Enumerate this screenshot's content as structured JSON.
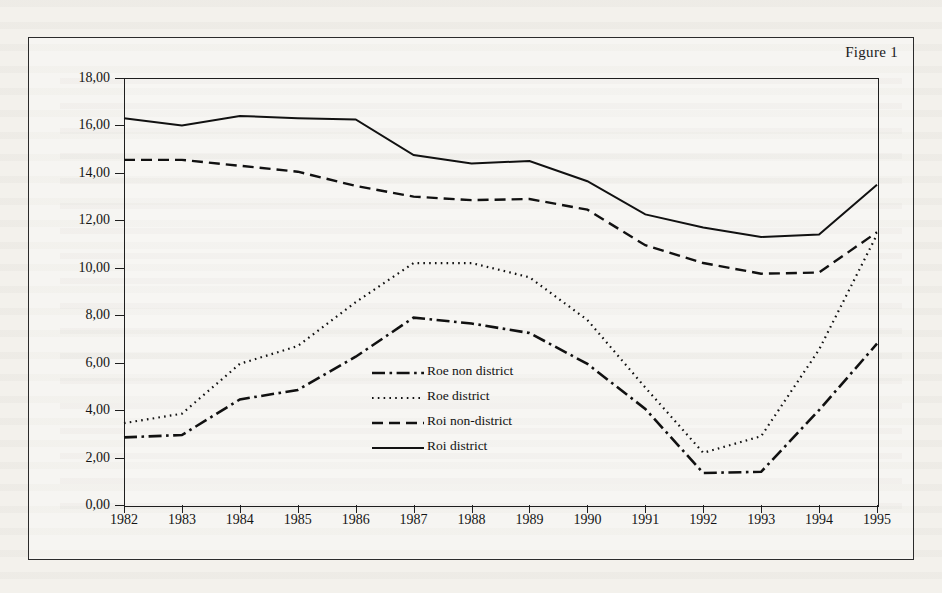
{
  "figure": {
    "label": "Figure 1"
  },
  "chart_data": {
    "type": "line",
    "title": "Figure 1",
    "xlabel": "",
    "ylabel": "",
    "grid": false,
    "legend_position": "center",
    "categories": [
      "1982",
      "1983",
      "1984",
      "1985",
      "1986",
      "1987",
      "1988",
      "1989",
      "1990",
      "1991",
      "1992",
      "1993",
      "1994",
      "1995"
    ],
    "xlim": [
      1982,
      1995
    ],
    "ylim": [
      0,
      18
    ],
    "ytick_labels": [
      "0,00",
      "2,00",
      "4,00",
      "6,00",
      "8,00",
      "10,00",
      "12,00",
      "14,00",
      "16,00",
      "18,00"
    ],
    "ytick_values": [
      0,
      2,
      4,
      6,
      8,
      10,
      12,
      14,
      16,
      18
    ],
    "series": [
      {
        "name": "Roe non district",
        "style": "dash-dot",
        "color": "#111111",
        "values": [
          2.85,
          2.95,
          4.45,
          4.85,
          6.25,
          7.9,
          7.65,
          7.25,
          5.95,
          4.05,
          1.35,
          1.4,
          4.0,
          6.8
        ]
      },
      {
        "name": "Roe district",
        "style": "dotted",
        "color": "#111111",
        "values": [
          3.45,
          3.85,
          5.95,
          6.7,
          8.55,
          10.2,
          10.2,
          9.6,
          7.8,
          4.95,
          2.2,
          2.9,
          6.55,
          11.4
        ]
      },
      {
        "name": "Roi non-district",
        "style": "dashed",
        "color": "#111111",
        "values": [
          14.55,
          14.55,
          14.3,
          14.05,
          13.45,
          13.0,
          12.85,
          12.9,
          12.45,
          10.95,
          10.2,
          9.75,
          9.8,
          11.5
        ]
      },
      {
        "name": "Roi district",
        "style": "solid",
        "color": "#111111",
        "values": [
          16.3,
          16.0,
          16.4,
          16.3,
          16.25,
          14.75,
          14.4,
          14.5,
          13.65,
          12.25,
          11.7,
          11.3,
          11.4,
          13.5
        ]
      }
    ]
  }
}
